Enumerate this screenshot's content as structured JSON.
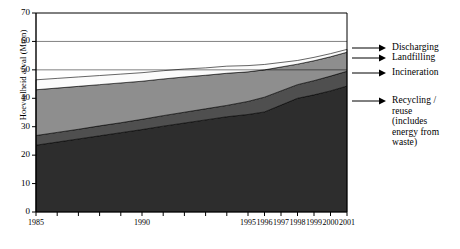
{
  "chart_data": {
    "type": "area",
    "title": "",
    "xlabel": "",
    "ylabel": "Hoeveelheid afval (Mton)",
    "ylim": [
      0,
      70
    ],
    "yticks": [
      0,
      10,
      20,
      30,
      40,
      50,
      60,
      70
    ],
    "grid": true,
    "gridlines_at": [
      50,
      60,
      70
    ],
    "legend_position": "right",
    "stacked": true,
    "x": [
      "1985",
      "1986",
      "1987",
      "1988",
      "1989",
      "1990",
      "1991",
      "1992",
      "1993",
      "1994",
      "1995",
      "1996",
      "1997",
      "1998",
      "1999",
      "2000",
      "2001"
    ],
    "xticks": [
      "1985",
      "1990",
      "1995",
      "1996",
      "1997",
      "1998",
      "1999",
      "2000",
      "2001"
    ],
    "series": [
      {
        "name": "Recycling / reuse (includes energy from waste)",
        "color": "#2d2d2d",
        "values": [
          23.5,
          24.6,
          25.7,
          26.8,
          27.9,
          29.0,
          30.2,
          31.3,
          32.4,
          33.5,
          34.3,
          35.2,
          37.6,
          40.0,
          41.2,
          42.6,
          44.3
        ]
      },
      {
        "name": "Incineration",
        "color": "#4f4f4f",
        "values": [
          3.4,
          3.4,
          3.4,
          3.5,
          3.5,
          3.6,
          3.7,
          3.8,
          3.9,
          4.0,
          4.6,
          5.2,
          5.0,
          4.8,
          5.0,
          5.2,
          5.2
        ]
      },
      {
        "name": "Landfilling",
        "color": "#8e8e8e",
        "values": [
          16.1,
          15.6,
          15.1,
          14.5,
          14.0,
          13.4,
          12.9,
          12.4,
          11.8,
          11.3,
          10.4,
          9.6,
          8.4,
          7.2,
          7.0,
          6.8,
          6.7
        ]
      },
      {
        "name": "Discharging",
        "color": "#fbfbfb",
        "values": [
          3.5,
          3.4,
          3.3,
          3.2,
          3.1,
          3.0,
          2.9,
          2.8,
          2.6,
          2.5,
          2.2,
          1.9,
          1.6,
          1.3,
          1.2,
          1.1,
          1.0
        ]
      }
    ],
    "totals": [
      46.5,
      47.0,
      47.5,
      48.0,
      48.5,
      49.0,
      49.7,
      50.3,
      50.7,
      51.3,
      51.5,
      51.9,
      52.6,
      53.3,
      54.4,
      55.7,
      57.2
    ]
  },
  "legend": {
    "items": [
      {
        "label": "Discharging"
      },
      {
        "label": "Landfilling"
      },
      {
        "label": "Incineration"
      },
      {
        "label": "Recycling /\nreuse\n(includes\nenergy from\nwaste)"
      }
    ]
  }
}
